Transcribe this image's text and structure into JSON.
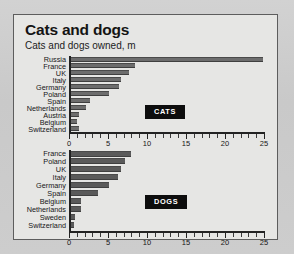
{
  "figure": {
    "title": "Cats and dogs",
    "subtitle": "Cats and dogs owned, m"
  },
  "chart_data": [
    {
      "type": "bar",
      "orientation": "horizontal",
      "title": "Cats and dogs",
      "subtitle": "Cats and dogs owned, m",
      "series_label": "CATS",
      "xlabel": "",
      "ylabel": "",
      "xlim": [
        0,
        25
      ],
      "xticks": [
        0,
        5,
        10,
        15,
        20,
        25
      ],
      "xticklabels": [
        "0",
        "5",
        "10",
        "15",
        "20",
        "25"
      ],
      "grid": false,
      "legend": "none",
      "categories": [
        "Russia",
        "France",
        "UK",
        "Italy",
        "Germany",
        "Poland",
        "Spain",
        "Netherlands",
        "Austria",
        "Belgium",
        "Switzerland"
      ],
      "values": [
        24.8,
        8.3,
        7.6,
        6.6,
        6.3,
        5.0,
        2.5,
        2.1,
        1.1,
        0.9,
        1.1
      ]
    },
    {
      "type": "bar",
      "orientation": "horizontal",
      "series_label": "DOGS",
      "xlabel": "",
      "ylabel": "",
      "xlim": [
        0,
        25
      ],
      "xticks": [
        0,
        5,
        10,
        15,
        20,
        25
      ],
      "xticklabels": [
        "0",
        "5",
        "10",
        "15",
        "20",
        "25"
      ],
      "grid": false,
      "legend": "none",
      "categories": [
        "France",
        "Poland",
        "UK",
        "Italy",
        "Germany",
        "Spain",
        "Belgium",
        "Netherlands",
        "Sweden",
        "Switzerland"
      ],
      "values": [
        7.8,
        7.1,
        6.6,
        6.2,
        5.0,
        3.6,
        1.4,
        1.4,
        0.7,
        0.5
      ]
    }
  ],
  "colors": {
    "bar_cats": "#6d6d6d",
    "bar_dogs": "#5a5a5a",
    "axis": "#232323",
    "badge_bg": "#0d0d0d",
    "badge_text": "#ffffff",
    "panel_bg": "#e6e6e4",
    "page_bg": "#cfcfcf"
  }
}
